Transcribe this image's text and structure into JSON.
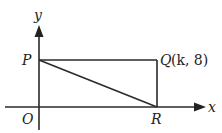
{
  "diagram": {
    "type": "coordinate-geometry",
    "axes": {
      "x_label": "x",
      "y_label": "y",
      "origin_label": "O"
    },
    "points": {
      "P": {
        "label": "P",
        "on": "y-axis"
      },
      "Q": {
        "label": "Q",
        "coords_text": "(k, 8)",
        "k": "k",
        "y": "8"
      },
      "R": {
        "label": "R",
        "on": "x-axis"
      }
    },
    "segments": [
      "PQ",
      "QR",
      "PR"
    ]
  },
  "labels": {
    "x": "x",
    "y": "y",
    "O": "O",
    "P": "P",
    "Q": "Q",
    "Q_coords": "(k, 8)",
    "R": "R"
  }
}
